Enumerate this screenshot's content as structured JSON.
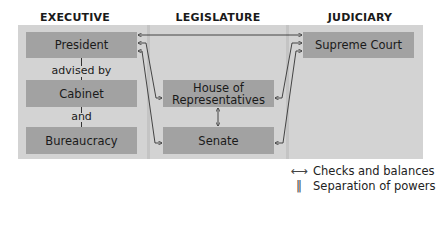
{
  "diagram": {
    "columns": [
      {
        "id": "executive",
        "heading": "EXECUTIVE"
      },
      {
        "id": "legislature",
        "heading": "LEGISLATURE"
      },
      {
        "id": "judiciary",
        "heading": "JUDICIARY"
      }
    ],
    "executive": {
      "president": "President",
      "advised_by": "advised by",
      "cabinet": "Cabinet",
      "and": "and",
      "bureaucracy": "Bureaucracy"
    },
    "legislature": {
      "house": "House of Representatives",
      "house_line1": "House of",
      "house_line2": "Representatives",
      "senate": "Senate"
    },
    "judiciary": {
      "supreme_court": "Supreme Court"
    },
    "legend": {
      "checks_icon": "⟷",
      "checks_label": "Checks and balances",
      "separation_icon": "‖",
      "separation_label": "Separation of powers"
    },
    "colors": {
      "panel": "#d3d3d3",
      "box": "#a2a2a2",
      "separator": "#c4c4c4",
      "line": "#333333"
    }
  }
}
